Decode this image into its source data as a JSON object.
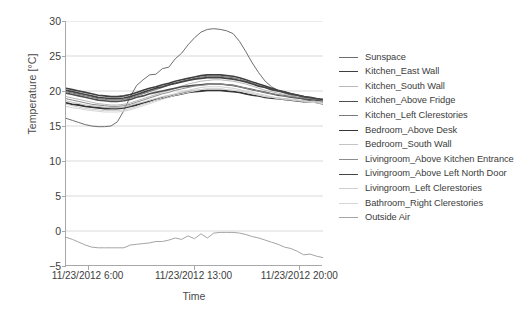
{
  "chart_data": {
    "type": "line",
    "title": "",
    "xlabel": "Time",
    "ylabel": "Temperature [°C]",
    "ylim": [
      -5,
      30
    ],
    "yticks": [
      -5,
      0,
      5,
      10,
      15,
      20,
      25,
      30
    ],
    "ytick_labels": [
      "−5",
      "0",
      "5",
      "10",
      "15",
      "20",
      "25",
      "30"
    ],
    "xlim": [
      "11/23/2012 4:30",
      "11/23/2012 21:30"
    ],
    "xticks": [
      "11/23/2012 6:00",
      "11/23/2012 13:00",
      "11/23/2012 20:00"
    ],
    "xtick_positions": [
      0.088,
      0.5,
      0.912
    ],
    "grid": "horizontal",
    "legend_position": "right",
    "x": [
      0,
      0.025,
      0.05,
      0.075,
      0.1,
      0.125,
      0.15,
      0.175,
      0.2,
      0.225,
      0.25,
      0.275,
      0.3,
      0.325,
      0.35,
      0.375,
      0.4,
      0.425,
      0.45,
      0.475,
      0.5,
      0.525,
      0.55,
      0.575,
      0.6,
      0.625,
      0.65,
      0.675,
      0.7,
      0.725,
      0.75,
      0.775,
      0.8,
      0.825,
      0.85,
      0.875,
      0.9,
      0.925,
      0.95,
      0.975,
      1.0
    ],
    "series": [
      {
        "name": "Sunspace",
        "color": "#6e6e6e",
        "width": 1.0,
        "values": [
          16.1,
          15.8,
          15.5,
          15.2,
          15.0,
          14.9,
          14.9,
          15.0,
          15.6,
          17.2,
          19.2,
          20.8,
          21.6,
          22.3,
          22.4,
          23.2,
          23.4,
          24.6,
          25.4,
          26.6,
          27.6,
          28.4,
          28.8,
          28.9,
          28.8,
          28.6,
          28.2,
          27.1,
          25.6,
          24.0,
          22.6,
          21.4,
          20.6,
          20.1,
          19.7,
          19.4,
          19.1,
          18.8,
          18.6,
          18.3,
          18.1
        ]
      },
      {
        "name": "Kitchen_East Wall",
        "color": "#3f3f3f",
        "width": 1.6,
        "values": [
          20.4,
          20.2,
          20.0,
          19.8,
          19.6,
          19.4,
          19.3,
          19.2,
          19.2,
          19.3,
          19.5,
          19.8,
          20.1,
          20.4,
          20.6,
          20.9,
          21.1,
          21.4,
          21.6,
          21.8,
          22.0,
          22.2,
          22.3,
          22.3,
          22.3,
          22.2,
          22.1,
          21.9,
          21.6,
          21.3,
          21.0,
          20.7,
          20.4,
          20.1,
          19.9,
          19.6,
          19.4,
          19.2,
          19.0,
          18.8,
          18.6
        ]
      },
      {
        "name": "Kitchen_South Wall",
        "color": "#b8b8b8",
        "width": 1.0,
        "values": [
          19.2,
          19.0,
          18.8,
          18.6,
          18.4,
          18.2,
          18.1,
          18.0,
          18.0,
          18.1,
          18.3,
          18.6,
          18.9,
          19.2,
          19.5,
          19.8,
          20.1,
          20.4,
          20.7,
          21.0,
          21.2,
          21.4,
          21.5,
          21.6,
          21.6,
          21.5,
          21.4,
          21.2,
          21.0,
          20.7,
          20.4,
          20.1,
          19.9,
          19.7,
          19.5,
          19.3,
          19.1,
          19.0,
          18.8,
          18.7,
          18.5
        ]
      },
      {
        "name": "Kitchen_Above Fridge",
        "color": "#4f4f4f",
        "width": 1.6,
        "values": [
          19.7,
          19.5,
          19.3,
          19.1,
          18.9,
          18.7,
          18.6,
          18.5,
          18.5,
          18.6,
          18.8,
          19.1,
          19.3,
          19.6,
          19.8,
          20.0,
          20.2,
          20.4,
          20.6,
          20.7,
          20.8,
          20.9,
          21.0,
          21.0,
          21.0,
          20.9,
          20.8,
          20.6,
          20.4,
          20.2,
          20.0,
          19.8,
          19.6,
          19.4,
          19.3,
          19.1,
          19.0,
          18.9,
          18.8,
          18.7,
          18.6
        ]
      },
      {
        "name": "Kitchen_Left Clerestories",
        "color": "#7a7a7a",
        "width": 1.0,
        "values": [
          19.9,
          19.7,
          19.5,
          19.3,
          19.1,
          18.9,
          18.8,
          18.7,
          18.7,
          18.8,
          19.0,
          19.3,
          19.6,
          19.9,
          20.2,
          20.5,
          20.8,
          21.1,
          21.4,
          21.6,
          21.8,
          22.0,
          22.1,
          22.1,
          22.1,
          22.0,
          21.9,
          21.7,
          21.4,
          21.1,
          20.8,
          20.5,
          20.2,
          20.0,
          19.8,
          19.6,
          19.4,
          19.2,
          19.0,
          18.9,
          18.7
        ]
      },
      {
        "name": "Bedroom_Above Desk",
        "color": "#353535",
        "width": 1.8,
        "values": [
          18.3,
          18.1,
          18.0,
          17.8,
          17.7,
          17.6,
          17.5,
          17.5,
          17.5,
          17.6,
          17.8,
          18.0,
          18.3,
          18.5,
          18.8,
          19.0,
          19.2,
          19.4,
          19.6,
          19.8,
          19.9,
          20.0,
          20.1,
          20.1,
          20.1,
          20.0,
          19.9,
          19.8,
          19.6,
          19.4,
          19.3,
          19.1,
          19.0,
          18.9,
          18.8,
          18.7,
          18.6,
          18.5,
          18.5,
          18.4,
          18.3
        ]
      },
      {
        "name": "Bedroom_South Wall",
        "color": "#c4c4c4",
        "width": 1.0,
        "values": [
          18.6,
          18.4,
          18.2,
          18.0,
          17.9,
          17.8,
          17.7,
          17.6,
          17.6,
          17.7,
          17.9,
          18.2,
          18.4,
          18.7,
          18.9,
          19.2,
          19.4,
          19.6,
          19.8,
          20.0,
          20.1,
          20.2,
          20.3,
          20.3,
          20.3,
          20.2,
          20.1,
          20.0,
          19.8,
          19.6,
          19.4,
          19.2,
          19.1,
          19.0,
          18.9,
          18.8,
          18.7,
          18.6,
          18.5,
          18.5,
          18.4
        ]
      },
      {
        "name": "Livingroom_Above Kitchen Entrance",
        "color": "#8c8c8c",
        "width": 1.0,
        "values": [
          18.9,
          18.7,
          18.5,
          18.3,
          18.1,
          18.0,
          17.9,
          17.8,
          17.8,
          17.9,
          18.1,
          18.4,
          18.7,
          19.0,
          19.3,
          19.6,
          19.8,
          20.1,
          20.3,
          20.5,
          20.7,
          20.8,
          20.9,
          21.0,
          21.0,
          20.9,
          20.8,
          20.6,
          20.4,
          20.2,
          20.0,
          19.8,
          19.6,
          19.5,
          19.3,
          19.2,
          19.1,
          19.0,
          18.9,
          18.8,
          18.7
        ]
      },
      {
        "name": "Livingroom_Above Left North Door",
        "color": "#444444",
        "width": 1.7,
        "values": [
          20.1,
          19.9,
          19.7,
          19.5,
          19.3,
          19.1,
          19.0,
          18.9,
          18.9,
          19.0,
          19.2,
          19.5,
          19.8,
          20.1,
          20.4,
          20.6,
          20.9,
          21.1,
          21.3,
          21.5,
          21.7,
          21.8,
          21.9,
          21.9,
          21.9,
          21.8,
          21.7,
          21.5,
          21.3,
          21.0,
          20.7,
          20.5,
          20.2,
          20.0,
          19.8,
          19.6,
          19.4,
          19.2,
          19.1,
          18.9,
          18.8
        ]
      },
      {
        "name": "Livingroom_Left Clerestories",
        "color": "#cfcfcf",
        "width": 1.0,
        "values": [
          18.1,
          17.9,
          17.7,
          17.5,
          17.4,
          17.3,
          17.2,
          17.2,
          17.2,
          17.3,
          17.5,
          17.8,
          18.1,
          18.4,
          18.7,
          19.0,
          19.3,
          19.6,
          19.9,
          20.1,
          20.3,
          20.5,
          20.6,
          20.6,
          20.6,
          20.5,
          20.4,
          20.2,
          20.0,
          19.8,
          19.6,
          19.4,
          19.2,
          19.0,
          18.9,
          18.8,
          18.7,
          18.6,
          18.5,
          18.4,
          18.3
        ]
      },
      {
        "name": "Bathroom_Right Clerestories",
        "color": "#d6d6d6",
        "width": 1.0,
        "values": [
          17.8,
          17.6,
          17.5,
          17.3,
          17.2,
          17.1,
          17.0,
          17.0,
          17.0,
          17.1,
          17.3,
          17.6,
          17.9,
          18.2,
          18.5,
          18.8,
          19.1,
          19.4,
          19.6,
          19.8,
          20.0,
          20.2,
          20.3,
          20.3,
          20.3,
          20.2,
          20.1,
          20.0,
          19.8,
          19.6,
          19.4,
          19.2,
          19.1,
          18.9,
          18.8,
          18.7,
          18.6,
          18.5,
          18.4,
          18.3,
          18.2
        ]
      },
      {
        "name": "Outside Air",
        "color": "#a5a5a5",
        "width": 1.0,
        "values": [
          -0.9,
          -1.2,
          -1.6,
          -2.0,
          -2.3,
          -2.4,
          -2.4,
          -2.4,
          -2.4,
          -2.4,
          -2.0,
          -1.9,
          -1.8,
          -1.7,
          -1.5,
          -1.5,
          -1.3,
          -1.0,
          -1.2,
          -0.7,
          -1.1,
          -0.4,
          -1.0,
          -0.3,
          -0.2,
          -0.2,
          -0.2,
          -0.3,
          -0.5,
          -0.8,
          -1.0,
          -1.3,
          -1.6,
          -1.9,
          -2.3,
          -2.5,
          -2.9,
          -3.4,
          -3.3,
          -3.6,
          -3.8
        ]
      }
    ]
  },
  "legend": {
    "items": [
      "Sunspace",
      "Kitchen_East Wall",
      "Kitchen_South Wall",
      "Kitchen_Above Fridge",
      "Kitchen_Left Clerestories",
      "Bedroom_Above Desk",
      "Bedroom_South Wall",
      "Livingroom_Above Kitchen Entrance",
      "Livingroom_Above Left North Door",
      "Livingroom_Left Clerestories",
      "Bathroom_Right Clerestories",
      "Outside Air"
    ]
  },
  "colors": {
    "axis": "#a8a8a8",
    "grid": "#d9d9d9",
    "text": "#3c3c3c",
    "background": "#ffffff"
  }
}
